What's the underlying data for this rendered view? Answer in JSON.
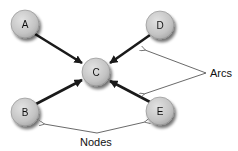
{
  "diagram": {
    "type": "directed-graph",
    "colors": {
      "node_fill_light": "#d6d6d6",
      "node_fill_dark": "#a9a9a9",
      "node_stroke": "#8a8a8a",
      "arc": "#1a1a1a",
      "callout": "#444444",
      "text": "#111111"
    },
    "nodes": [
      {
        "id": "A",
        "label": "A",
        "x": 25,
        "y": 24
      },
      {
        "id": "B",
        "label": "B",
        "x": 25,
        "y": 112
      },
      {
        "id": "C",
        "label": "C",
        "x": 96,
        "y": 72
      },
      {
        "id": "D",
        "label": "D",
        "x": 160,
        "y": 25
      },
      {
        "id": "E",
        "label": "E",
        "x": 160,
        "y": 111
      }
    ],
    "arcs": [
      {
        "from": "A",
        "to": "C"
      },
      {
        "from": "B",
        "to": "C"
      },
      {
        "from": "D",
        "to": "C"
      },
      {
        "from": "E",
        "to": "C"
      }
    ],
    "callouts": {
      "arcs": {
        "label": "Arcs"
      },
      "nodes": {
        "label": "Nodes"
      }
    }
  }
}
